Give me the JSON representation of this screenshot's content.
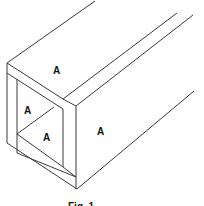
{
  "figure": {
    "caption": "Fig. 1",
    "labels": {
      "top_face": "A",
      "inner_left_wall": "A",
      "inner_bottom_wall": "A",
      "right_face": "A"
    },
    "stroke_color": "#3a3a3a",
    "background": "#ffffff"
  }
}
